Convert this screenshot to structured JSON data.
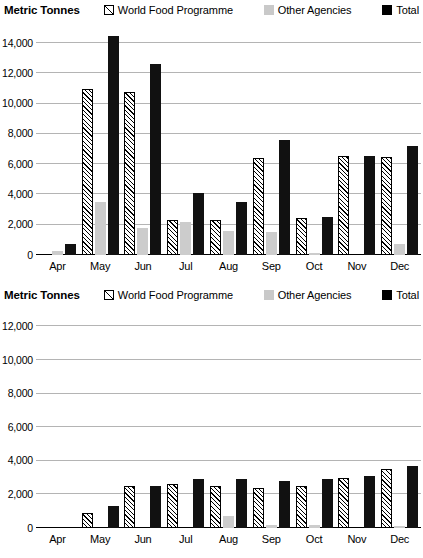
{
  "charts": [
    {
      "id": "chart-1",
      "title": "Metric Tonnes",
      "legend": [
        {
          "icon": "hatched-square-icon",
          "label": "World Food Programme",
          "key": "wfp"
        },
        {
          "icon": "gray-square-icon",
          "label": "Other Agencies",
          "key": "other"
        },
        {
          "icon": "black-square-icon",
          "label": "Total",
          "key": "total"
        }
      ],
      "yticks": [
        "14,000",
        "12,000",
        "10,000",
        "8,000",
        "6,000",
        "4,000",
        "2,000"
      ],
      "yzero": "0",
      "chart_data": {
        "type": "bar",
        "title": "Metric Tonnes",
        "xlabel": "",
        "ylabel": "Metric Tonnes",
        "ylim": [
          0,
          15000
        ],
        "ytick_values": [
          0,
          2000,
          4000,
          6000,
          8000,
          10000,
          12000,
          14000
        ],
        "grid": true,
        "legend_position": "top-right",
        "categories": [
          "Apr",
          "May",
          "Jun",
          "Jul",
          "Aug",
          "Sep",
          "Oct",
          "Nov",
          "Dec"
        ],
        "series": [
          {
            "name": "World Food Programme",
            "values": [
              0,
              11000,
              10800,
              2300,
              2300,
              6400,
              2450,
              6550,
              6500
            ]
          },
          {
            "name": "Other Agencies",
            "values": [
              250,
              3500,
              1800,
              2200,
              1600,
              1500,
              100,
              0,
              700
            ]
          },
          {
            "name": "Total",
            "values": [
              700,
              14500,
              12600,
              4100,
              3500,
              7600,
              2500,
              6550,
              7200
            ]
          }
        ]
      }
    },
    {
      "id": "chart-2",
      "title": "Metric Tonnes",
      "legend": [
        {
          "icon": "hatched-square-icon",
          "label": "World Food Programme",
          "key": "wfp"
        },
        {
          "icon": "gray-square-icon",
          "label": "Other Agencies",
          "key": "other"
        },
        {
          "icon": "black-square-icon",
          "label": "Total",
          "key": "total"
        }
      ],
      "yticks": [
        "12,000",
        "10,000",
        "8,000",
        "6,000",
        "4,000",
        "2,000"
      ],
      "yzero": "0",
      "chart_data": {
        "type": "bar",
        "title": "Metric Tonnes",
        "xlabel": "",
        "ylabel": "Metric Tonnes",
        "ylim": [
          0,
          12800
        ],
        "ytick_values": [
          0,
          2000,
          4000,
          6000,
          8000,
          10000,
          12000
        ],
        "grid": true,
        "legend_position": "top-right",
        "categories": [
          "Apr",
          "May",
          "Jun",
          "Jul",
          "Aug",
          "Sep",
          "Oct",
          "Nov",
          "Dec"
        ],
        "series": [
          {
            "name": "World Food Programme",
            "values": [
              0,
              900,
              2500,
              2600,
              2500,
              2400,
              2500,
              3000,
              3500
            ]
          },
          {
            "name": "Other Agencies",
            "values": [
              0,
              0,
              0,
              0,
              700,
              150,
              200,
              0,
              130
            ]
          },
          {
            "name": "Total",
            "values": [
              0,
              1300,
              2500,
              2900,
              2900,
              2800,
              2900,
              3100,
              3700
            ]
          }
        ]
      }
    }
  ]
}
